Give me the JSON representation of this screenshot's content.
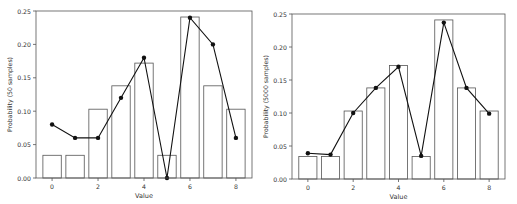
{
  "chart_data": [
    {
      "type": "bar",
      "overlay": "line",
      "title": "",
      "xlabel": "Value",
      "ylabel": "Probability (50 samples)",
      "categories": [
        0,
        1,
        2,
        3,
        4,
        5,
        6,
        7,
        8
      ],
      "x_ticks": [
        0,
        2,
        4,
        6,
        8
      ],
      "y_ticks": [
        "0.00",
        "0.05",
        "0.10",
        "0.15",
        "0.20",
        "0.25"
      ],
      "ylim": [
        0,
        0.25
      ],
      "xlim": [
        -0.7,
        8.7
      ],
      "grid": false,
      "series": [
        {
          "name": "true distribution (bars)",
          "values": [
            0.034,
            0.034,
            0.103,
            0.138,
            0.172,
            0.034,
            0.241,
            0.138,
            0.103
          ]
        },
        {
          "name": "empirical (line)",
          "values": [
            0.08,
            0.06,
            0.06,
            0.12,
            0.18,
            0.0,
            0.24,
            0.2,
            0.06
          ]
        }
      ]
    },
    {
      "type": "bar",
      "overlay": "line",
      "title": "",
      "xlabel": "Value",
      "ylabel": "Probability (5000 samples)",
      "categories": [
        0,
        1,
        2,
        3,
        4,
        5,
        6,
        7,
        8
      ],
      "x_ticks": [
        0,
        2,
        4,
        6,
        8
      ],
      "y_ticks": [
        "0.00",
        "0.05",
        "0.10",
        "0.15",
        "0.20",
        "0.25"
      ],
      "ylim": [
        0,
        0.25
      ],
      "xlim": [
        -0.7,
        8.7
      ],
      "grid": false,
      "series": [
        {
          "name": "true distribution (bars)",
          "values": [
            0.034,
            0.034,
            0.103,
            0.138,
            0.172,
            0.034,
            0.241,
            0.138,
            0.103
          ]
        },
        {
          "name": "empirical (line)",
          "values": [
            0.039,
            0.037,
            0.1,
            0.138,
            0.17,
            0.035,
            0.237,
            0.138,
            0.099
          ]
        }
      ]
    }
  ],
  "colors": {
    "bar_edge": "#555555",
    "bar_fill": "#ffffff",
    "line": "#111111",
    "axis": "#555555"
  }
}
